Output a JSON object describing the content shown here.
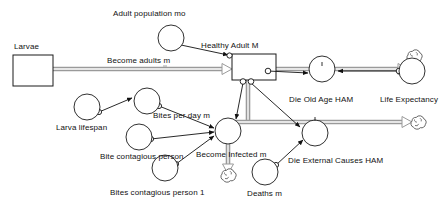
{
  "diagram": {
    "type": "stock-and-flow",
    "title": "",
    "canvas": {
      "width": 448,
      "height": 212,
      "background": "#ffffff"
    },
    "colors": {
      "outline": "#1a1a1a",
      "flow_pipe": "#9a9a9a",
      "text": "#111111",
      "fill": "#ffffff"
    },
    "stocks": [
      {
        "id": "larvae",
        "label": "Larvae",
        "x": 13,
        "y": 55,
        "w": 40,
        "h": 31,
        "label_x": 14,
        "label_y": 43
      },
      {
        "id": "healthy_adult_m",
        "label": "Healthy Adult M",
        "x": 232,
        "y": 54,
        "w": 44,
        "h": 26,
        "label_x": 200,
        "label_y": 42
      }
    ],
    "flows": [
      {
        "id": "become_adults_m",
        "label": "Become adults m",
        "valve_x": 228,
        "valve_y": 69,
        "label_x": 107,
        "label_y": 57
      },
      {
        "id": "die_old_age_ham",
        "label": "Die Old Age HAM",
        "valve_x": 322,
        "valve_y": 69,
        "label_x": 289,
        "label_y": 96
      },
      {
        "id": "become_infected_m",
        "label": "Become Infected m",
        "valve_x": 228,
        "valve_y": 131,
        "label_x": 196,
        "label_y": 151
      },
      {
        "id": "die_external_causes_ham",
        "label": "Die External Causes HAM",
        "valve_x": 315,
        "valve_y": 133,
        "label_x": 288,
        "label_y": 157
      }
    ],
    "variables": [
      {
        "id": "adult_population_mo",
        "label": "Adult population mo",
        "cx": 171,
        "cy": 38,
        "r": 13,
        "label_x": 113,
        "label_y": 9
      },
      {
        "id": "larva_lifespan",
        "label": "Larva lifespan",
        "cx": 87,
        "cy": 107,
        "r": 13,
        "label_x": 56,
        "label_y": 124
      },
      {
        "id": "bites_per_day_m",
        "label": "Bites per day m",
        "cx": 147,
        "cy": 101,
        "r": 13,
        "label_x": 153,
        "label_y": 112
      },
      {
        "id": "bite_contagious_person",
        "label": "Bite contagious person",
        "cx": 139,
        "cy": 137,
        "r": 13,
        "label_x": 100,
        "label_y": 153
      },
      {
        "id": "bites_contagious_person_1",
        "label": "Bites contagious person 1",
        "cx": 165,
        "cy": 168,
        "r": 13,
        "label_x": 110,
        "label_y": 189
      },
      {
        "id": "life_expectancy",
        "label": "Life Expectancy",
        "cx": 412,
        "cy": 71,
        "r": 13,
        "label_x": 380,
        "label_y": 96
      },
      {
        "id": "deaths_m",
        "label": "Deaths m",
        "cx": 265,
        "cy": 172,
        "r": 13,
        "label_x": 247,
        "label_y": 190
      }
    ],
    "clouds": [
      {
        "id": "cloud-old-age-sink",
        "cx": 414,
        "cy": 58,
        "r": 8
      },
      {
        "id": "cloud-external-causes-sink",
        "cx": 418,
        "cy": 124,
        "r": 8
      },
      {
        "id": "cloud-infected-sink",
        "cx": 228,
        "cy": 177,
        "r": 8
      }
    ],
    "connectors": [
      {
        "from": "adult_population_mo",
        "to": "healthy_adult_m"
      },
      {
        "from": "larva_lifespan",
        "to": "bites_per_day_m"
      },
      {
        "from": "bites_per_day_m",
        "to": "become_infected_m"
      },
      {
        "from": "bite_contagious_person",
        "to": "become_infected_m"
      },
      {
        "from": "bites_contagious_person_1",
        "to": "become_infected_m"
      },
      {
        "from": "healthy_adult_m",
        "to": "die_old_age_ham"
      },
      {
        "from": "life_expectancy",
        "to": "die_old_age_ham"
      },
      {
        "from": "healthy_adult_m",
        "to": "become_infected_m"
      },
      {
        "from": "healthy_adult_m",
        "to": "die_external_causes_ham"
      },
      {
        "from": "deaths_m",
        "to": "die_external_causes_ham"
      }
    ]
  }
}
